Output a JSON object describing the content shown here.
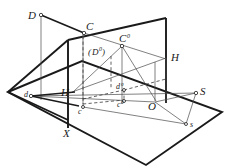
{
  "figure": {
    "type": "line-drawing",
    "colors": {
      "ink": "#1a1a1a",
      "thin": "#555555",
      "background": "#ffffff"
    },
    "labels": {
      "d_upper": "D",
      "c_upper": "C",
      "c_zero": "C",
      "d_zero_paren_open": "(",
      "d_zero": "D",
      "d_zero_paren_close": ")",
      "h_left": "H",
      "h_right": "H",
      "s_upper": "S",
      "o_upper": "O",
      "x_upper": "X",
      "d_low": "d",
      "c_low": "c",
      "d_low_zero": "d",
      "c_low_zero": "c",
      "s_low": "s",
      "sup_circle": "0"
    }
  },
  "geometry": {
    "ground_plane": [
      [
        8,
        92
      ],
      [
        82,
        61
      ],
      [
        222,
        112
      ],
      [
        146,
        165
      ]
    ],
    "vertical_plane": [
      [
        68,
        40
      ],
      [
        166,
        18
      ],
      [
        166,
        103
      ],
      [
        68,
        120
      ]
    ],
    "left_plane": [
      [
        8,
        92
      ],
      [
        68,
        40
      ],
      [
        68,
        120
      ]
    ],
    "points": {
      "D": [
        40,
        12
      ],
      "C": [
        83,
        30
      ],
      "C0": [
        122,
        44
      ],
      "D0": [
        111,
        52
      ],
      "O": [
        155,
        102
      ],
      "X": [
        68,
        128
      ],
      "S": [
        196,
        92
      ],
      "s": [
        186,
        124
      ],
      "d": [
        30,
        96
      ],
      "c": [
        79,
        106
      ],
      "d0": [
        124,
        89
      ],
      "c0": [
        124,
        100
      ],
      "H_left": [
        72,
        92
      ],
      "H_right": [
        176,
        57
      ]
    }
  }
}
